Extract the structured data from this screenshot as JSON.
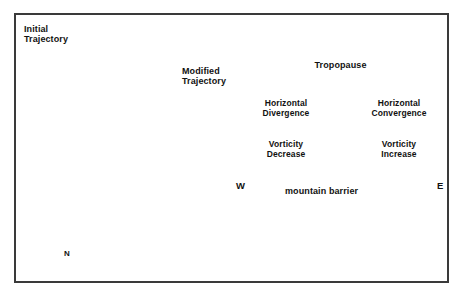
{
  "figure": {
    "panels": [
      "terrain-map",
      "cross-section"
    ]
  },
  "left_panel": {
    "name": "terrain-map-with-trajectories",
    "labels": {
      "initial_trajectory": "Initial\nTrajectory",
      "modified_trajectory": "Modified\nTrajectory",
      "north": "N"
    },
    "trajectories": [
      {
        "id": 1,
        "straight_from": [
          22,
          63
        ],
        "straight_to": [
          100,
          63
        ],
        "dashed_to": [
          150,
          63
        ],
        "curve_end": [
          222,
          135
        ]
      },
      {
        "id": 2,
        "straight_from": [
          22,
          150
        ],
        "straight_to": [
          100,
          150
        ],
        "dashed_to": [
          152,
          150
        ],
        "curve_end": [
          222,
          205
        ]
      },
      {
        "id": 3,
        "straight_from": [
          22,
          196
        ],
        "straight_to": [
          100,
          196
        ],
        "dashed_to": [
          152,
          196
        ],
        "curve_end": [
          222,
          255
        ]
      }
    ],
    "compass": {
      "direction": "north",
      "x": 68,
      "tail_y": 252,
      "head_y": 222
    }
  },
  "right_panel": {
    "name": "atmospheric-cross-section",
    "labels": {
      "tropopause": "Tropopause",
      "horizontal_divergence": "Horizontal\nDivergence",
      "horizontal_convergence": "Horizontal\nConvergence",
      "vorticity_decrease": "Vorticity\nDecrease",
      "vorticity_increase": "Vorticity\nIncrease",
      "mountain_barrier": "mountain barrier",
      "west": "W",
      "east": "E"
    },
    "tropopause_line": {
      "style": "dashed",
      "y": 77
    },
    "arrows": [
      {
        "name": "divergence-arrow",
        "x1": 243,
        "x2": 327,
        "y": 126
      },
      {
        "name": "convergence-arrow",
        "x1": 355,
        "x2": 439,
        "y": 126
      }
    ],
    "mountain": {
      "left_base_x": 232,
      "peak_x": 337,
      "peak_y": 148,
      "right_base_x": 449,
      "base_y": 208,
      "fill_color": "#c4c4c4",
      "outline_color": "#2b2b2b"
    },
    "ground_line_y": 210
  },
  "colors": {
    "frame": "#3a3a3a",
    "ink": "#111111",
    "mountain_fill": "#c4c4c4",
    "terrain_base": "#f2f2f2",
    "terrain_shade": "#b9b9b9",
    "page_background": "#ffffff"
  }
}
